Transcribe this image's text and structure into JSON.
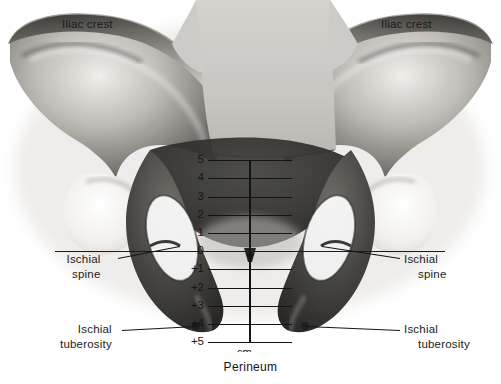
{
  "figure": {
    "caption": "Perineum",
    "unit_label": "cm.",
    "modality": "grayscale-radiograph"
  },
  "annotations": [
    {
      "id": "iliac-crest-left",
      "line1": "Iliac crest",
      "line2": "",
      "side": "left",
      "x": 62,
      "y": 18
    },
    {
      "id": "iliac-crest-right",
      "line1": "Iliac crest",
      "line2": "",
      "side": "right",
      "x": 381,
      "y": 18
    },
    {
      "id": "ischial-spine-left",
      "line1": "Ischial",
      "line2": "spine",
      "side": "left",
      "x": 62,
      "y": 252
    },
    {
      "id": "ischial-spine-right",
      "line1": "Ischial",
      "line2": "spine",
      "side": "right",
      "x": 404,
      "y": 252
    },
    {
      "id": "ischial-tuberosity-left",
      "line1": "Ischial",
      "line2": "tuberosity",
      "side": "left",
      "x": 50,
      "y": 322
    },
    {
      "id": "ischial-tuberosity-right",
      "line1": "Ischial",
      "line2": "tuberosity",
      "side": "right",
      "x": 404,
      "y": 322
    }
  ],
  "chart_data": {
    "type": "scale",
    "unit": "cm.",
    "ylabel": "cm.",
    "axis_label_bottom": "cm.",
    "zero_reference": "interspinous line (ischial spines)",
    "orientation": "vertical-descending",
    "ticks": [
      {
        "label": "5",
        "value": -5,
        "y": 160,
        "half_width": 42
      },
      {
        "label": "4",
        "value": -4,
        "y": 178,
        "half_width": 42
      },
      {
        "label": "3",
        "value": -3,
        "y": 197,
        "half_width": 42
      },
      {
        "label": "2",
        "value": -2,
        "y": 215,
        "half_width": 42
      },
      {
        "label": "1",
        "value": -1,
        "y": 233,
        "half_width": 42
      },
      {
        "label": "0",
        "value": 0,
        "y": 251,
        "half_width": 195
      },
      {
        "label": "+1",
        "value": 1,
        "y": 269,
        "half_width": 42
      },
      {
        "label": "+2",
        "value": 2,
        "y": 288,
        "half_width": 42
      },
      {
        "label": "+3",
        "value": 3,
        "y": 306,
        "half_width": 42
      },
      {
        "label": "+4",
        "value": 4,
        "y": 324,
        "half_width": 42
      },
      {
        "label": "+5",
        "value": 5,
        "y": 342,
        "half_width": 42
      }
    ],
    "axis_x": 250,
    "axis_top": 160,
    "axis_bottom": 342
  },
  "colors": {
    "ink": "#141414",
    "page_background": "#ffffff",
    "bone_light": "#d9d7d2",
    "bone_mid": "#9b9892",
    "bone_dark": "#4a4843",
    "shadow": "#2a2927",
    "mask_grey": "#c9c7c2"
  }
}
